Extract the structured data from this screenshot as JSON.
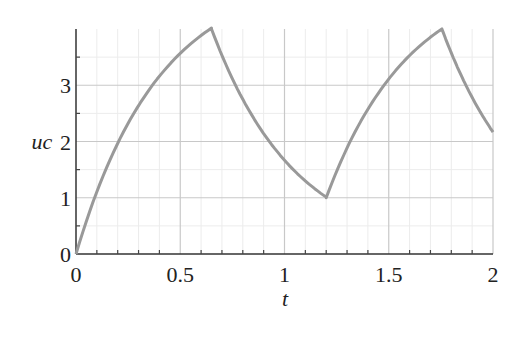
{
  "chart_data": {
    "type": "line",
    "title": "",
    "xlabel": "t",
    "ylabel": "uc",
    "xlim": [
      0,
      2
    ],
    "ylim": [
      0,
      4
    ],
    "grid": true,
    "legend": null,
    "x_ticks": [
      "0",
      "0.5",
      "1",
      "1.5",
      "2"
    ],
    "y_ticks": [
      "0",
      "1",
      "2",
      "3"
    ],
    "series": [
      {
        "name": "uc",
        "color": "#999999",
        "x": [
          0,
          0.1,
          0.2,
          0.3,
          0.4,
          0.5,
          0.6,
          0.65,
          0.75,
          0.85,
          0.95,
          1.05,
          1.15,
          1.2,
          1.3,
          1.4,
          1.5,
          1.6,
          1.7,
          1.755,
          1.85,
          1.95,
          2.0
        ],
        "values": [
          0,
          1.11,
          1.97,
          2.64,
          3.16,
          3.57,
          3.88,
          4.0,
          3.12,
          2.43,
          1.89,
          1.47,
          1.15,
          1.0,
          1.88,
          2.57,
          3.11,
          3.53,
          3.85,
          4.0,
          3.15,
          2.45,
          2.17
        ]
      }
    ],
    "annotations": []
  }
}
